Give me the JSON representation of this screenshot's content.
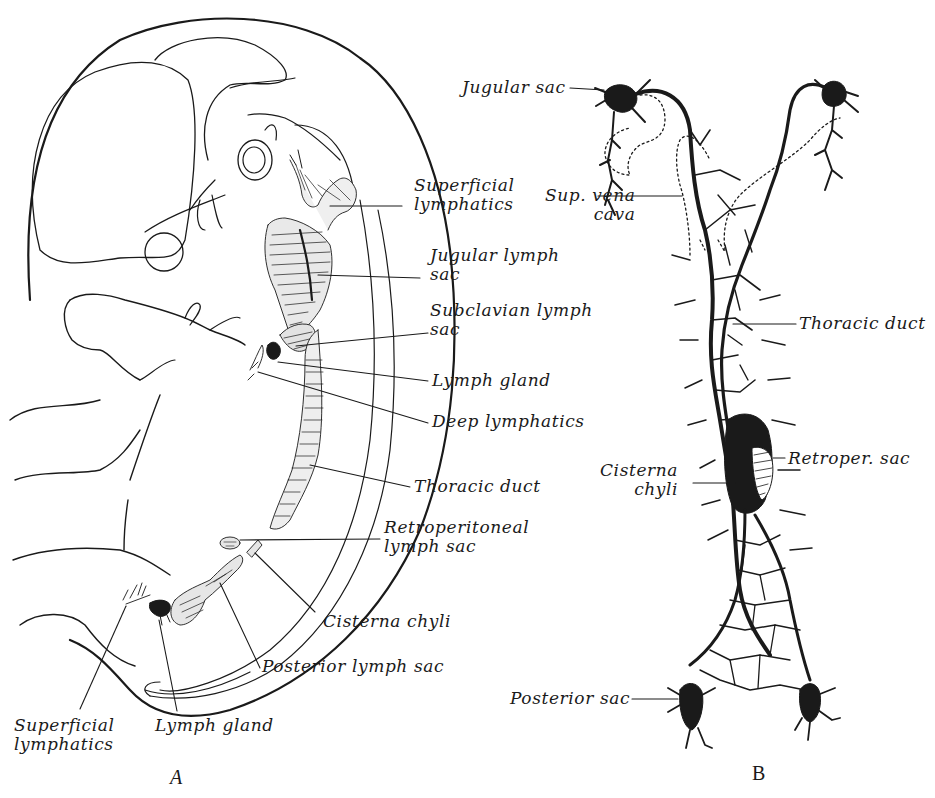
{
  "figure": {
    "panels": [
      {
        "id": "A",
        "letter": "A",
        "subject": "embryo-lateral-view",
        "labels": {
          "superficial_lymphatics_top": "Superficial\nlymphatics",
          "jugular_lymph_sac": "Jugular lymph\nsac",
          "subclavian_lymph_sac": "Subclavian lymph\nsac",
          "lymph_gland_upper": "Lymph gland",
          "deep_lymphatics": "Deep lymphatics",
          "thoracic_duct": "Thoracic duct",
          "retroperitoneal_lymph_sac": "Retroperitoneal\nlymph sac",
          "cisterna_chyli": "Cisterna chyli",
          "posterior_lymph_sac": "Posterior lymph sac",
          "superficial_lymphatics_bottom": "Superficial\nlymphatics",
          "lymph_gland_lower": "Lymph gland"
        }
      },
      {
        "id": "B",
        "letter": "B",
        "subject": "lymphatic-system-schematic",
        "labels": {
          "jugular_sac": "Jugular sac",
          "sup_vena_cava": "Sup. vena\ncava",
          "thoracic_duct": "Thoracic duct",
          "cisterna_chyli": "Cisterna\nchyli",
          "retroper_sac": "Retroper. sac",
          "posterior_sac": "Posterior sac"
        }
      }
    ],
    "colors": {
      "ink": "#1a1a1a",
      "paper": "#ffffff"
    }
  }
}
